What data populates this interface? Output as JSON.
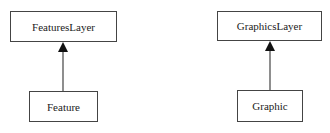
{
  "diagram": {
    "nodes": [
      {
        "id": "features-layer",
        "label": "FeaturesLayer"
      },
      {
        "id": "feature",
        "label": "Feature"
      },
      {
        "id": "graphics-layer",
        "label": "GraphicsLayer"
      },
      {
        "id": "graphic",
        "label": "Graphic"
      }
    ],
    "edges": [
      {
        "from": "feature",
        "to": "features-layer",
        "type": "generalization"
      },
      {
        "from": "graphic",
        "to": "graphics-layer",
        "type": "generalization"
      }
    ],
    "colors": {
      "stroke": "#444444",
      "arrow": "#111111",
      "background": "#ffffff"
    }
  }
}
